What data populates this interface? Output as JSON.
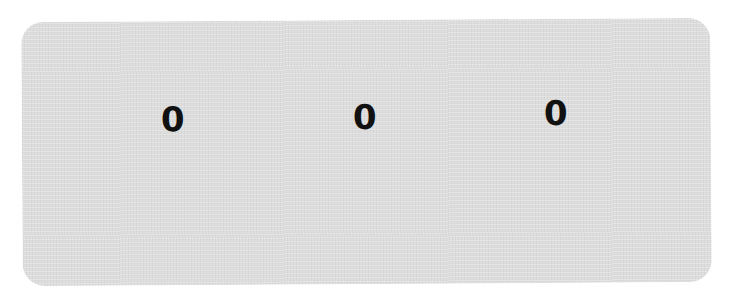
{
  "display": {
    "digits": [
      {
        "value": "0"
      },
      {
        "value": "0"
      },
      {
        "value": "0"
      }
    ],
    "colors": {
      "panel_background": "#dcdcdc",
      "digit_color": "#111111",
      "page_background": "#ffffff"
    }
  }
}
